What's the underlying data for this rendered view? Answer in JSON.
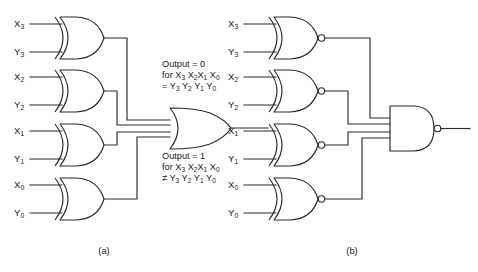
{
  "figure": {
    "background_color": "#ffffff",
    "line_color": "#2b2b2b",
    "text_color": "#1a1a1a"
  },
  "panels": [
    {
      "id": "a",
      "caption": "(a)",
      "gate_type_inputs": "xor-gate",
      "gate_type_output": "or-gate",
      "output_label": "",
      "inputs": [
        {
          "x_label": "X",
          "x_sub": "3",
          "y_label": "Y",
          "y_sub": "3"
        },
        {
          "x_label": "X",
          "x_sub": "2",
          "y_label": "Y",
          "y_sub": "2"
        },
        {
          "x_label": "X",
          "x_sub": "1",
          "y_label": "Y",
          "y_sub": "1"
        },
        {
          "x_label": "X",
          "x_sub": "0",
          "y_label": "Y",
          "y_sub": "0"
        }
      ],
      "notes": [
        {
          "id": "output-zero-note",
          "line1": "Output = 0",
          "line2_prefix": "for ",
          "line2_terms": [
            {
              "base": "X",
              "sub": "3"
            },
            {
              "base": "X",
              "sub": "2"
            },
            {
              "base": "X",
              "sub": "1"
            },
            {
              "base": "X",
              "sub": "0"
            }
          ],
          "line3_prefix": "= ",
          "line3_terms": [
            {
              "base": "Y",
              "sub": "3"
            },
            {
              "base": "Y",
              "sub": "2"
            },
            {
              "base": "Y",
              "sub": "1"
            },
            {
              "base": "Y",
              "sub": "0"
            }
          ]
        },
        {
          "id": "output-one-note",
          "line1": "Output = 1",
          "line2_prefix": "for ",
          "line2_terms": [
            {
              "base": "X",
              "sub": "3"
            },
            {
              "base": "X",
              "sub": "2"
            },
            {
              "base": "X",
              "sub": "1"
            },
            {
              "base": "X",
              "sub": "0"
            }
          ],
          "line3_prefix": "≠ ",
          "line3_terms": [
            {
              "base": "Y",
              "sub": "3"
            },
            {
              "base": "Y",
              "sub": "2"
            },
            {
              "base": "Y",
              "sub": "1"
            },
            {
              "base": "Y",
              "sub": "0"
            }
          ]
        }
      ]
    },
    {
      "id": "b",
      "caption": "(b)",
      "gate_type_inputs": "xnor-gate",
      "gate_type_output": "nand-gate",
      "output_label": "",
      "inputs": [
        {
          "x_label": "X",
          "x_sub": "3",
          "y_label": "Y",
          "y_sub": "3"
        },
        {
          "x_label": "X",
          "x_sub": "2",
          "y_label": "Y",
          "y_sub": "2"
        },
        {
          "x_label": "X",
          "x_sub": "1",
          "y_label": "Y",
          "y_sub": "1"
        },
        {
          "x_label": "X",
          "x_sub": "0",
          "y_label": "Y",
          "y_sub": "0"
        }
      ],
      "notes": []
    }
  ],
  "text_fragments": {
    "a_note0_l1": "Output = 0",
    "a_note1_l1": "Output = 1",
    "a_note_for": "for",
    "a_note_eq": "=",
    "a_note_neq": "≠",
    "caption_a": "(a)",
    "caption_b": "(b)"
  }
}
